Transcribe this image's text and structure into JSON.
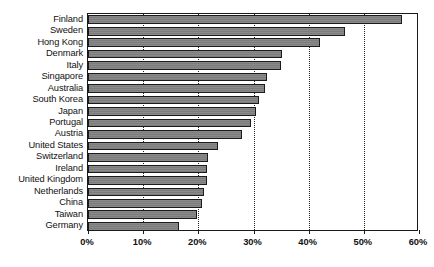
{
  "chart_data": {
    "type": "bar",
    "orientation": "horizontal",
    "title": "",
    "subtitle": "",
    "xlabel": "",
    "ylabel": "",
    "xlim": [
      0,
      60
    ],
    "xtick_labels": [
      "0%",
      "10%",
      "20%",
      "30%",
      "40%",
      "50%",
      "60%"
    ],
    "xticks": [
      0,
      10,
      20,
      30,
      40,
      50,
      60
    ],
    "grid": "vertical-dotted",
    "legend": "none",
    "categories": [
      "Finland",
      "Sweden",
      "Hong Kong",
      "Denmark",
      "Italy",
      "Singapore",
      "Australia",
      "South Korea",
      "Japan",
      "Portugal",
      "Austria",
      "United States",
      "Switzerland",
      "Ireland",
      "United Kingdom",
      "Netherlands",
      "China",
      "Taiwan",
      "Germany"
    ],
    "values": [
      57.0,
      46.5,
      42.0,
      35.2,
      35.0,
      32.5,
      32.0,
      31.0,
      30.5,
      29.5,
      28.0,
      23.5,
      21.8,
      21.6,
      21.5,
      21.0,
      20.7,
      19.7,
      16.5
    ],
    "bar_color": "#808080",
    "bar_border_color": "#1b1b1b",
    "grid_color": "#222222"
  }
}
